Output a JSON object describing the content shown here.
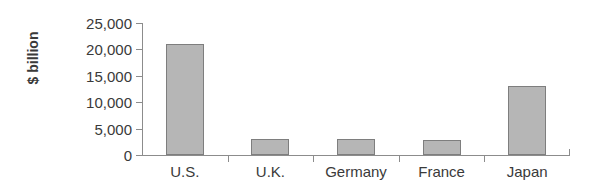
{
  "chart_data": {
    "type": "bar",
    "title": "",
    "xlabel": "",
    "ylabel": "$ billion",
    "categories": [
      "U.S.",
      "U.K.",
      "Germany",
      "France",
      "Japan"
    ],
    "values": [
      21000,
      3100,
      3100,
      2900,
      13000
    ],
    "ylim": [
      0,
      25000
    ],
    "yticks": [
      0,
      5000,
      10000,
      15000,
      20000,
      25000
    ],
    "ytick_labels": [
      "0",
      "5,000",
      "10,000",
      "15,000",
      "20,000",
      "25,000"
    ],
    "grid": false,
    "legend": "none",
    "bar_fill_color": "#b6b6b6",
    "bar_border_color": "#7e7e7e",
    "axis_color": "#8c8c8c",
    "text_color": "#3a3a3a",
    "background_color": "#ffffff"
  }
}
